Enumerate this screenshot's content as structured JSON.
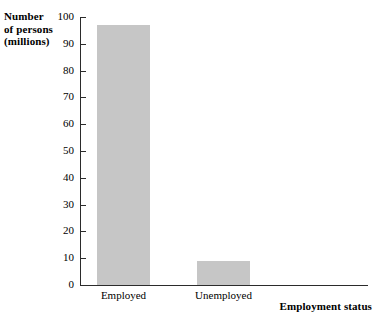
{
  "chart_data": {
    "type": "bar",
    "title": "",
    "subtitle": "",
    "xlabel": "Employment status",
    "ylabel": "Number of persons (millions)",
    "ylabel_lines": [
      "Number",
      "of persons",
      "(millions)"
    ],
    "categories": [
      "Employed",
      "Unemployed"
    ],
    "values": [
      97,
      9
    ],
    "ylim": [
      0,
      100
    ],
    "ytick_labels": [
      "0",
      "10",
      "20",
      "30",
      "40",
      "50",
      "60",
      "70",
      "80",
      "90",
      "100"
    ],
    "ytick_values": [
      0,
      10,
      20,
      30,
      40,
      50,
      60,
      70,
      80,
      90,
      100
    ],
    "grid": false,
    "legend": false,
    "legend_position": "none",
    "bar_color": "#c6c6c6",
    "axis_color": "#2b2b2b",
    "background_color": "#ffffff"
  }
}
